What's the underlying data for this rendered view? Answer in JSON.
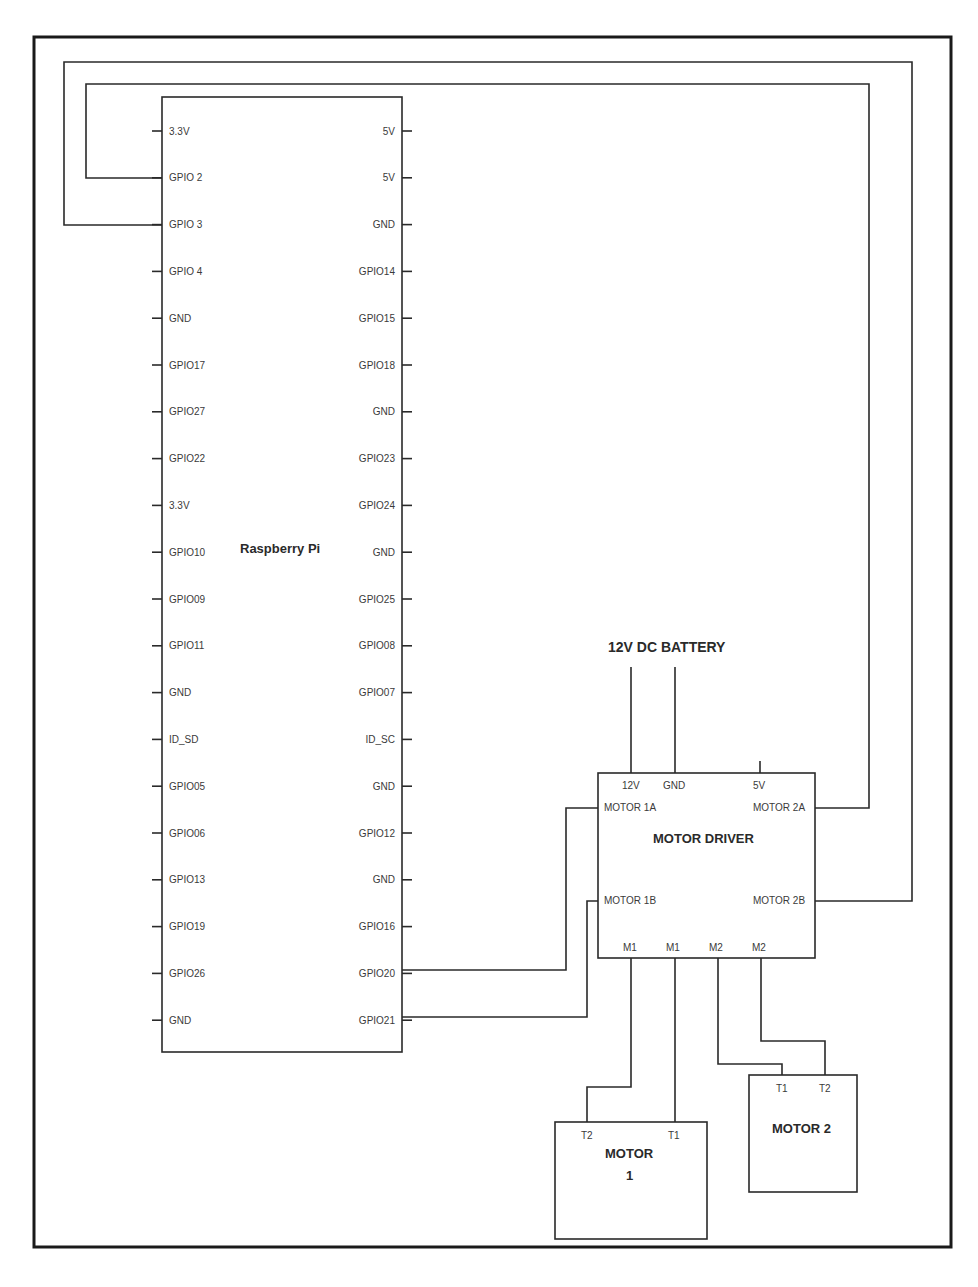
{
  "diagram": {
    "type": "wiring-schematic",
    "colors": {
      "line": "#2a2a2a",
      "text": "#3a3a3a",
      "background": "#ffffff"
    },
    "raspberry_pi": {
      "title": "Raspberry Pi",
      "left_pins": [
        "3.3V",
        "GPIO 2",
        "GPIO 3",
        "GPIO 4",
        "GND",
        "GPIO17",
        "GPIO27",
        "GPIO22",
        "3.3V",
        "GPIO10",
        "GPIO09",
        "GPIO11",
        "GND",
        "ID_SD",
        "GPIO05",
        "GPIO06",
        "GPIO13",
        "GPIO19",
        "GPIO26",
        "GND"
      ],
      "right_pins": [
        "5V",
        "5V",
        "GND",
        "GPIO14",
        "GPIO15",
        "GPIO18",
        "GND",
        "GPIO23",
        "GPIO24",
        "GND",
        "GPIO25",
        "GPIO08",
        "GPIO07",
        "ID_SC",
        "GND",
        "GPIO12",
        "GND",
        "GPIO16",
        "GPIO20",
        "GPIO21"
      ]
    },
    "battery": {
      "label": "12V DC BATTERY"
    },
    "motor_driver": {
      "title": "MOTOR DRIVER",
      "top_pins": [
        "12V",
        "GND",
        "5V"
      ],
      "left_pins": [
        "MOTOR 1A",
        "MOTOR 1B"
      ],
      "right_pins": [
        "MOTOR 2A",
        "MOTOR 2B"
      ],
      "bottom_pins": [
        "M1",
        "M1",
        "M2",
        "M2"
      ]
    },
    "motor1": {
      "title_line1": "MOTOR",
      "title_line2": "1",
      "pins": [
        "T2",
        "T1"
      ]
    },
    "motor2": {
      "title": "MOTOR 2",
      "pins": [
        "T1",
        "T2"
      ]
    },
    "connections": [
      {
        "from": "Raspberry Pi GPIO 2",
        "to": "MOTOR DRIVER MOTOR 2A"
      },
      {
        "from": "Raspberry Pi GPIO 3",
        "to": "MOTOR DRIVER MOTOR 2B"
      },
      {
        "from": "Raspberry Pi GPIO20",
        "to": "MOTOR DRIVER MOTOR 1A"
      },
      {
        "from": "Raspberry Pi GPIO21",
        "to": "MOTOR DRIVER MOTOR 1B"
      },
      {
        "from": "12V DC BATTERY",
        "to": "MOTOR DRIVER 12V"
      },
      {
        "from": "12V DC BATTERY",
        "to": "MOTOR DRIVER GND"
      },
      {
        "from": "MOTOR DRIVER M1",
        "to": "MOTOR 1 T2"
      },
      {
        "from": "MOTOR DRIVER M1",
        "to": "MOTOR 1 T1"
      },
      {
        "from": "MOTOR DRIVER M2",
        "to": "MOTOR 2 T1"
      },
      {
        "from": "MOTOR DRIVER M2",
        "to": "MOTOR 2 T2"
      }
    ]
  }
}
